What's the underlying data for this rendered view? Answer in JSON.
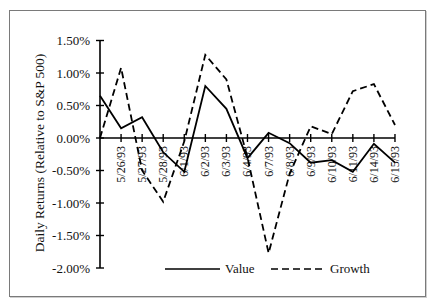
{
  "chart_data": {
    "type": "line",
    "title": "",
    "xlabel": "",
    "ylabel": "Daily Returns (Relative to S&P 500)",
    "ylim": [
      -2.0,
      1.5
    ],
    "yticks": [
      "1.50%",
      "1.00%",
      "0.50%",
      "0.00%",
      "-0.50%",
      "-1.00%",
      "-1.50%",
      "-2.00%"
    ],
    "ytick_values": [
      1.5,
      1.0,
      0.5,
      0.0,
      -0.5,
      -1.0,
      -1.5,
      -2.0
    ],
    "grid": false,
    "legend_position": "bottom",
    "categories": [
      "",
      "5/26/93",
      "5/27/93",
      "5/28/93",
      "6/1/93",
      "6/2/93",
      "6/3/93",
      "6/4/93",
      "6/7/93",
      "6/8/93",
      "6/9/93",
      "6/10/93",
      "6/11/93",
      "6/14/93",
      "6/15/93"
    ],
    "series": [
      {
        "name": "Value",
        "style": "solid",
        "values": [
          0.65,
          0.15,
          0.32,
          -0.22,
          -0.52,
          0.8,
          0.45,
          -0.31,
          0.08,
          -0.08,
          -0.38,
          -0.34,
          -0.52,
          -0.09,
          -0.38
        ]
      },
      {
        "name": "Growth",
        "style": "dashed",
        "values": [
          0.0,
          1.08,
          -0.5,
          -0.98,
          -0.05,
          1.28,
          0.9,
          -0.3,
          -1.77,
          -0.55,
          0.18,
          0.06,
          0.72,
          0.83,
          0.2
        ]
      }
    ]
  },
  "legend": {
    "value_label": "Value",
    "growth_label": "Growth"
  }
}
